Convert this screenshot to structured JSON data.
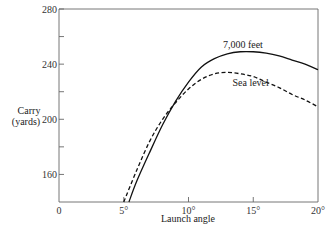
{
  "chart_data": {
    "type": "line",
    "title": "",
    "xlabel": "Launch angle",
    "ylabel": "Carry (yards)",
    "ylabel_lines": [
      "Carry",
      "(yards)"
    ],
    "xlim": [
      0,
      20
    ],
    "ylim": [
      140,
      280
    ],
    "grid": false,
    "legend": "inline labels",
    "x_ticks": [
      {
        "value": 0,
        "label": "0"
      },
      {
        "value": 5,
        "label": "5°"
      },
      {
        "value": 10,
        "label": "10°"
      },
      {
        "value": 15,
        "label": "15°"
      },
      {
        "value": 20,
        "label": "20°"
      }
    ],
    "y_ticks": [
      {
        "value": 160,
        "label": "160"
      },
      {
        "value": 180,
        "label": ""
      },
      {
        "value": 200,
        "label": "200"
      },
      {
        "value": 220,
        "label": ""
      },
      {
        "value": 240,
        "label": "240"
      },
      {
        "value": 260,
        "label": ""
      },
      {
        "value": 280,
        "label": "280"
      }
    ],
    "series": [
      {
        "name": "7,000 feet",
        "style": "solid",
        "label_pos": {
          "x": 14.2,
          "y": 252
        },
        "x": [
          5.4,
          6,
          7,
          8,
          9,
          10,
          11,
          12,
          13,
          14,
          15,
          16,
          17,
          18,
          19,
          20
        ],
        "values": [
          140,
          155,
          176,
          196,
          213,
          227,
          238,
          244,
          247.5,
          249,
          249,
          248,
          246,
          243,
          240,
          236
        ]
      },
      {
        "name": "Sea level",
        "style": "dashed",
        "label_pos": {
          "x": 14.8,
          "y": 224
        },
        "x": [
          5.0,
          6,
          7,
          8,
          9,
          10,
          11,
          12,
          13,
          14,
          15,
          16,
          17,
          18,
          19,
          20
        ],
        "values": [
          140,
          163,
          184,
          200,
          212,
          222,
          229,
          233,
          234,
          233,
          231,
          227,
          223,
          218,
          214,
          209
        ]
      }
    ]
  },
  "labels": {
    "xlabel": "Launch angle",
    "ylabel_line1": "Carry",
    "ylabel_line2": "(yards)",
    "series_solid": "7,000 feet",
    "series_dashed": "Sea level"
  }
}
